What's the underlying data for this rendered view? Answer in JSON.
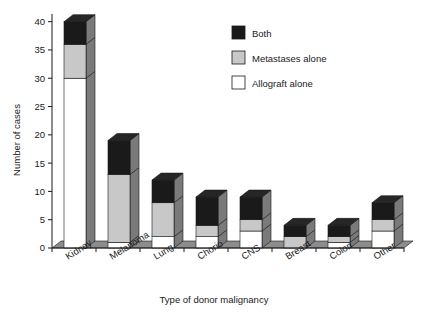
{
  "chart_data": {
    "type": "bar",
    "subtype": "stacked-3d-column",
    "title": "",
    "xlabel": "Type of donor malignancy",
    "ylabel": "Number of cases",
    "categories": [
      "Kidney",
      "Melanoma",
      "Lung",
      "Chorio",
      "CNS",
      "Breast",
      "Colon",
      "Other"
    ],
    "series": [
      {
        "name": "Allograft alone",
        "color": "#ffffff",
        "values": [
          30,
          1,
          2,
          2,
          3,
          0,
          1,
          3
        ]
      },
      {
        "name": "Metastases alone",
        "color": "#c8c8c8",
        "values": [
          6,
          12,
          6,
          2,
          2,
          2,
          1,
          2
        ]
      },
      {
        "name": "Both",
        "color": "#1a1a1a",
        "values": [
          4,
          6,
          4,
          5,
          4,
          2,
          2,
          3
        ]
      }
    ],
    "totals": [
      40,
      19,
      12,
      9,
      9,
      4,
      4,
      8
    ],
    "ylim": [
      0,
      41
    ],
    "yticks": [
      0,
      5,
      10,
      15,
      20,
      25,
      30,
      35,
      40
    ],
    "ytick_labels": [
      "0",
      "5",
      "10",
      "15",
      "20",
      "25",
      "30",
      "35",
      "40"
    ],
    "grid": false,
    "legend_position": "top-right",
    "stack_order_bottom_to_top": [
      "Allograft alone",
      "Metastases alone",
      "Both"
    ]
  },
  "legend": {
    "entries": [
      {
        "label": "Both",
        "swatch": "#1a1a1a"
      },
      {
        "label": "Metastases alone",
        "swatch": "#c8c8c8"
      },
      {
        "label": "Allograft alone",
        "swatch": "#ffffff"
      }
    ]
  },
  "axes": {
    "y_title": "Number of cases",
    "x_title": "Type of donor malignancy"
  },
  "colors": {
    "both": "#1a1a1a",
    "metastases": "#c8c8c8",
    "allograft": "#ffffff",
    "side_face": "#7a7a7a",
    "top_face_dark": "#262626",
    "top_face_light": "#b0b0b0",
    "top_face_white": "#d8d8d8",
    "floor": "#8c8c8c",
    "axis": "#1a1a1a",
    "outline": "#1a1a1a"
  }
}
